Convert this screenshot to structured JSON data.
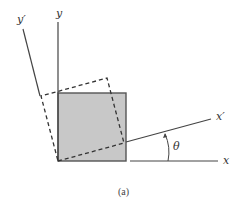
{
  "figure": {
    "caption": "(a)",
    "labels": {
      "y": "y",
      "y_prime": "y′",
      "x": "x",
      "x_prime": "x′",
      "theta": "θ"
    },
    "colors": {
      "square_fill": "#c8c8c8",
      "square_stroke": "#555555",
      "axis": "#444444",
      "dashed": "#333333",
      "background": "#ffffff"
    },
    "elements": [
      "original axes x-y",
      "rotated axes x'-y' by angle theta",
      "shaded square aligned with x-y",
      "dashed square aligned with x'-y'"
    ]
  }
}
